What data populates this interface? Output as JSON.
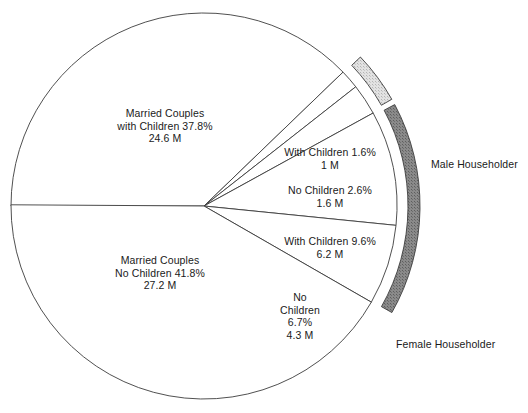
{
  "chart_data": {
    "type": "pie",
    "title": "",
    "subtitle": "",
    "xlabel": "",
    "ylabel": "",
    "legend_position": "right",
    "grid": false,
    "total_label": "",
    "center": {
      "x": 204,
      "y": 206
    },
    "radius": 193,
    "start_angle_deg": 180,
    "direction": "counterclockwise-from-left",
    "categories": [
      "Married Couples with Children",
      "Male Householder With Children",
      "Male Householder No Children",
      "Female Householder With Children",
      "Female Householder No Children",
      "Married Couples No Children"
    ],
    "values": [
      37.8,
      1.6,
      2.6,
      9.6,
      6.7,
      41.8
    ],
    "counts_millions": [
      24.6,
      1.0,
      1.6,
      6.2,
      4.3,
      27.2
    ],
    "slices": [
      {
        "id": "married-with-children",
        "group": "Married Couples",
        "percent": 37.8,
        "percent_text": "37.8%",
        "count_text": "24.6 M",
        "sweep_deg": 136.08,
        "label_lines": [
          "Married Couples",
          "with Children 37.8%",
          "24.6 M"
        ],
        "label_x": 165,
        "label_y": 107
      },
      {
        "id": "male-with-children",
        "group": "Male Householder",
        "percent": 1.6,
        "percent_text": "1.6%",
        "count_text": "1 M",
        "sweep_deg": 5.76,
        "label_lines": [
          "With Children 1.6%",
          "1 M"
        ],
        "label_x": 330,
        "label_y": 146
      },
      {
        "id": "male-no-children",
        "group": "Male Householder",
        "percent": 2.6,
        "percent_text": "2.6%",
        "count_text": "1.6 M",
        "sweep_deg": 9.36,
        "label_lines": [
          "No Children 2.6%",
          "1.6 M"
        ],
        "label_x": 330,
        "label_y": 184
      },
      {
        "id": "female-with-children",
        "group": "Female Householder",
        "percent": 9.6,
        "percent_text": "9.6%",
        "count_text": "6.2 M",
        "sweep_deg": 34.56,
        "label_lines": [
          "With Children 9.6%",
          "6.2 M"
        ],
        "label_x": 330,
        "label_y": 235
      },
      {
        "id": "female-no-children",
        "group": "Female Householder",
        "percent": 6.7,
        "percent_text": "6.7%",
        "count_text": "4.3 M",
        "sweep_deg": 24.12,
        "label_lines": [
          "No",
          "Children",
          "6.7%",
          "4.3 M"
        ],
        "label_x": 300,
        "label_y": 291
      },
      {
        "id": "married-no-children",
        "group": "Married Couples",
        "percent": 41.8,
        "percent_text": "41.8%",
        "count_text": "27.2 M",
        "sweep_deg": 150.48,
        "label_lines": [
          "Married Couples",
          "No Children 41.8%",
          "27.2 M"
        ],
        "label_x": 160,
        "label_y": 254
      }
    ],
    "annotations": [
      {
        "id": "male-householder-bracket",
        "text": "Male Householder",
        "x": 431,
        "y": 158,
        "band_color": "#d0d0d0",
        "covers": [
          "male-with-children",
          "male-no-children"
        ],
        "covers_percent": 4.2
      },
      {
        "id": "female-householder-bracket",
        "text": "Female Householder",
        "x": 396,
        "y": 338,
        "band_color": "#7a7a7a",
        "covers": [
          "female-with-children",
          "female-no-children"
        ],
        "covers_percent": 16.3
      }
    ],
    "colors": {
      "background": "#ffffff",
      "slice_fill": "#ffffff",
      "outline": "#3c3c3c",
      "male_band": "#d0d0d0",
      "female_band": "#7a7a7a",
      "text": "#1a1a1a"
    }
  },
  "legend": {
    "items": [
      {
        "label": "Male Householder",
        "color": "#d0d0d0"
      },
      {
        "label": "Female Householder",
        "color": "#7a7a7a"
      }
    ]
  }
}
